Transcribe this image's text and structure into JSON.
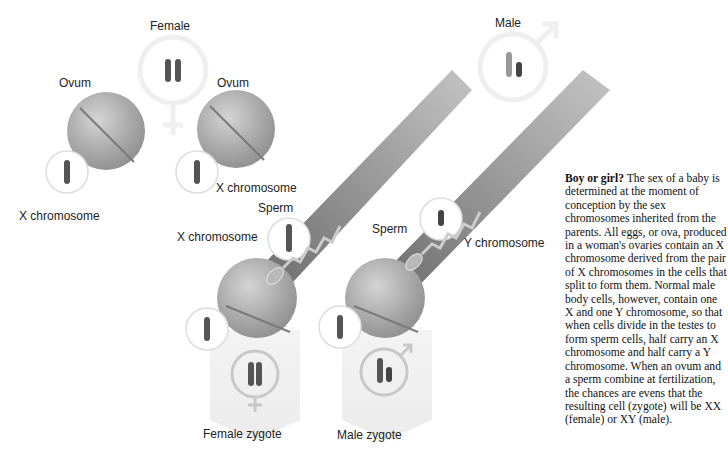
{
  "labels": {
    "female": "Female",
    "male": "Male",
    "ovum_left": "Ovum",
    "ovum_right": "Ovum",
    "x_chrom_left": "X chromosome",
    "x_chrom_right": "X chromosome",
    "sperm_left": "Sperm",
    "sperm_right": "Sperm",
    "x_chrom_sperm": "X chromosome",
    "y_chrom_sperm": "Y chromosome",
    "female_zygote": "Female zygote",
    "male_zygote": "Male zygote"
  },
  "caption": {
    "title": "Boy or girl?",
    "body": " The sex of a baby is determined at the moment of conception by the sex chromosomes inherited from the parents. All eggs, or ova, produced in a woman's ovaries contain an X chromosome derived from the pair of X chromosomes in the cells that split to form them. Normal male body cells, however, contain one X and one Y chromosome, so that when cells divide in the testes to form sperm cells, half carry an X chromosome and half carry a Y chromosome. When an ovum and a sperm combine at fertilization, the chances are evens that the resulting cell (zygote) will be XX (female) or XY (male)."
  },
  "colors": {
    "chromosome": "#555555",
    "cell": "#a8a8a8",
    "band": "#8a8a8a",
    "circle": "#dddddd"
  }
}
